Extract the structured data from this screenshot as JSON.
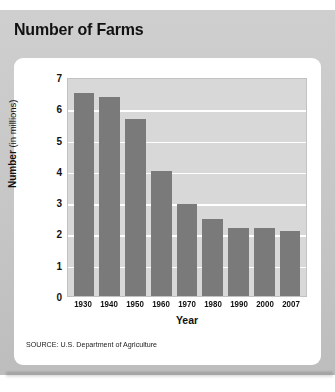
{
  "title": "Number of Farms",
  "source": "SOURCE: U.S. Department of Agriculture",
  "colors": {
    "bar": "#7a7a7a",
    "plot_background": "#d8d8d8",
    "gridline": "#ffffff",
    "card": "#ffffff",
    "frame": "#c9c9c9",
    "text": "#111111"
  },
  "axis": {
    "y_title_bold": "Number",
    "y_title_rest": " (in millions)",
    "x_title": "Year",
    "y_ticks": [
      "7",
      "6",
      "5",
      "4",
      "3",
      "2",
      "1",
      "0"
    ]
  },
  "chart_data": {
    "type": "bar",
    "title": "Number of Farms",
    "xlabel": "Year",
    "ylabel": "Number (in millions)",
    "categories": [
      "1930",
      "1940",
      "1950",
      "1960",
      "1970",
      "1980",
      "1990",
      "2000",
      "2007"
    ],
    "values": [
      6.5,
      6.35,
      5.65,
      4.0,
      2.95,
      2.45,
      2.17,
      2.17,
      2.08
    ],
    "ylim": [
      0,
      7
    ],
    "ytick_step": 1,
    "grid": true,
    "legend": false,
    "annotation": "SOURCE: U.S. Department of Agriculture"
  }
}
